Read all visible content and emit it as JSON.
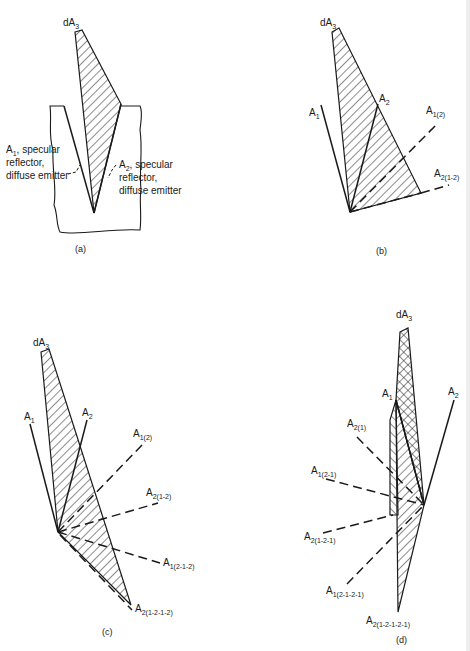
{
  "figure": {
    "panels": [
      {
        "id": "a",
        "caption": "(a)",
        "labels": {
          "dA": "dA",
          "dA_sub": "3",
          "A1": "A",
          "A1_sub": "1",
          "A1_desc_1": ", specular",
          "A1_desc_2": "reflector,",
          "A1_desc_3": "diffuse emitter",
          "A2": "A",
          "A2_sub": "2",
          "A2_desc_1": ", specular",
          "A2_desc_2": "reflector,",
          "A2_desc_3": "diffuse emitter"
        }
      },
      {
        "id": "b",
        "caption": "(b)",
        "labels": {
          "dA": "dA",
          "dA_sub": "3",
          "A1": "A",
          "A1_sub": "1",
          "A2": "A",
          "A2_sub": "2",
          "A1_2": "A",
          "A1_2_sub": "1(2)",
          "A2_12": "A",
          "A2_12_sub": "2(1-2)"
        }
      },
      {
        "id": "c",
        "caption": "(c)",
        "labels": {
          "dA": "dA",
          "dA_sub": "3",
          "A1": "A",
          "A1_sub": "1",
          "A2": "A",
          "A2_sub": "2",
          "A1_2": "A",
          "A1_2_sub": "1(2)",
          "A2_12": "A",
          "A2_12_sub": "2(1-2)",
          "A1_212": "A",
          "A1_212_sub": "1(2-1-2)",
          "A2_1212": "A",
          "A2_1212_sub": "2(1-2-1-2)"
        }
      },
      {
        "id": "d",
        "caption": "(d)",
        "labels": {
          "dA": "dA",
          "dA_sub": "3",
          "A1": "A",
          "A1_sub": "1",
          "A2": "A",
          "A2_sub": "2",
          "A2_1": "A",
          "A2_1_sub": "2(1)",
          "A1_21": "A",
          "A1_21_sub": "1(2-1)",
          "A2_121": "A",
          "A2_121_sub": "2(1-2-1)",
          "A1_2121": "A",
          "A1_2121_sub": "1(2-1-2-1)",
          "A2_12121": "A",
          "A2_12121_sub": "2(1-2-1-2-1)"
        }
      }
    ],
    "colors": {
      "ink": "#1a1a1a",
      "background": "#ffffff"
    }
  }
}
